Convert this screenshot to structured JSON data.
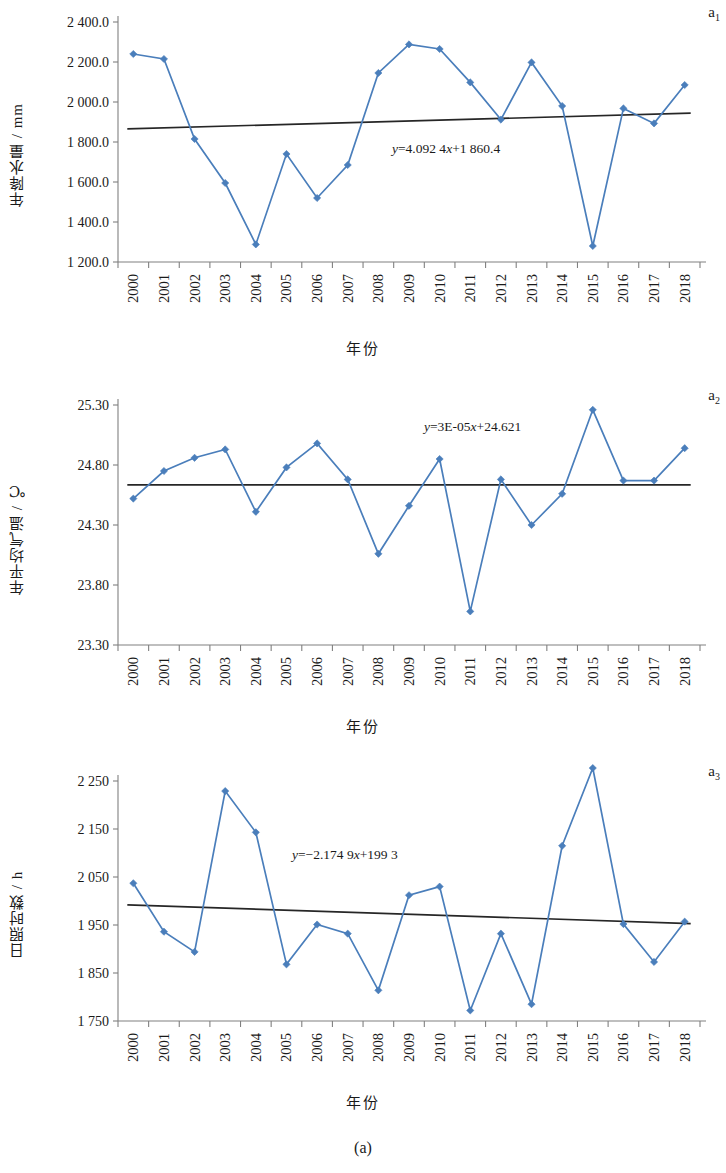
{
  "figure": {
    "caption": "(a)",
    "accent_color": "#4a7ebb",
    "trend_color": "#262626",
    "axis_color": "#808080"
  },
  "panels": [
    {
      "tag": "a",
      "tag_sub": "1",
      "equation": "y=4.092 4x+1 860.4",
      "chart_data": {
        "type": "line",
        "title": "",
        "xlabel": "年份",
        "ylabel": "年降水量 / mm",
        "ylim": [
          1200.0,
          2400.0
        ],
        "ytick_labels": [
          "1 200.0",
          "1 400.0",
          "1 600.0",
          "1 800.0",
          "2 000.0",
          "2 200.0",
          "2 400.0"
        ],
        "ytick_values": [
          1200,
          1400,
          1600,
          1800,
          2000,
          2200,
          2400
        ],
        "grid": false,
        "legend": "none",
        "categories": [
          "2000",
          "2001",
          "2002",
          "2003",
          "2004",
          "2005",
          "2006",
          "2007",
          "2008",
          "2009",
          "2010",
          "2011",
          "2012",
          "2013",
          "2014",
          "2015",
          "2016",
          "2017",
          "2018"
        ],
        "series": [
          {
            "name": "年降水量",
            "values": [
              2240,
              2215,
              1815,
              1595,
              1288,
              1740,
              1520,
              1685,
              2145,
              2288,
              2265,
              2098,
              1912,
              2198,
              1980,
              1280,
              1968,
              1893,
              2085
            ]
          }
        ],
        "trendline": {
          "label": "y=4.092 4x+1 860.4",
          "slope": 4.0924,
          "intercept": 1860.4,
          "y_start": 1866,
          "y_end": 1944
        }
      }
    },
    {
      "tag": "a",
      "tag_sub": "2",
      "equation": "y=3E-05x+24.621",
      "chart_data": {
        "type": "line",
        "title": "",
        "xlabel": "年份",
        "ylabel": "年平均气温 / ℃",
        "ylim": [
          23.3,
          25.3
        ],
        "ytick_labels": [
          "23.30",
          "23.80",
          "24.30",
          "24.80",
          "25.30"
        ],
        "ytick_values": [
          23.3,
          23.8,
          24.3,
          24.8,
          25.3
        ],
        "grid": false,
        "legend": "none",
        "categories": [
          "2000",
          "2001",
          "2002",
          "2003",
          "2004",
          "2005",
          "2006",
          "2007",
          "2008",
          "2009",
          "2010",
          "2011",
          "2012",
          "2013",
          "2014",
          "2015",
          "2016",
          "2017",
          "2018"
        ],
        "series": [
          {
            "name": "年平均气温",
            "values": [
              24.52,
              24.75,
              24.86,
              24.93,
              24.41,
              24.78,
              24.98,
              24.68,
              24.06,
              24.46,
              24.85,
              23.58,
              24.68,
              24.3,
              24.56,
              25.26,
              24.67,
              24.67,
              24.94
            ]
          }
        ],
        "trendline": {
          "label": "y=3E-05x+24.621",
          "slope": 3e-05,
          "intercept": 24.621,
          "y_start": 24.635,
          "y_end": 24.635
        }
      }
    },
    {
      "tag": "a",
      "tag_sub": "3",
      "equation": "y=−2.174 9x+199 3",
      "chart_data": {
        "type": "line",
        "title": "",
        "xlabel": "年份",
        "ylabel": "日照时数 / h",
        "ylim": [
          1750,
          2250
        ],
        "ytick_labels": [
          "1 750",
          "1 850",
          "1 950",
          "2 050",
          "2 150",
          "2 250"
        ],
        "ytick_values": [
          1750,
          1850,
          1950,
          2050,
          2150,
          2250
        ],
        "grid": false,
        "legend": "none",
        "categories": [
          "2000",
          "2001",
          "2002",
          "2003",
          "2004",
          "2005",
          "2006",
          "2007",
          "2008",
          "2009",
          "2010",
          "2011",
          "2012",
          "2013",
          "2014",
          "2015",
          "2016",
          "2017",
          "2018"
        ],
        "series": [
          {
            "name": "日照时数",
            "values": [
              2037,
              1936,
              1894,
              2229,
              2143,
              1868,
              1951,
              1932,
              1814,
              2012,
              2030,
              1772,
              1932,
              1785,
              2115,
              2277,
              1952,
              1873,
              1957
            ]
          }
        ],
        "trendline": {
          "label": "y=−2.174 9x+199 3",
          "slope": -2.1749,
          "intercept": 1993,
          "y_start": 1992,
          "y_end": 1953
        }
      }
    }
  ]
}
